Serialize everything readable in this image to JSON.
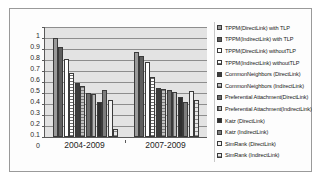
{
  "chart": {
    "type": "bar",
    "title": "",
    "xlabel": "",
    "ylabel": "",
    "ylim": [
      0,
      1
    ],
    "ytick_labels": [
      "1",
      "0.9",
      "0.8",
      "0.7",
      "0.6",
      "0.5",
      "0.4",
      "0.3",
      "0.2",
      "0.1",
      "0"
    ],
    "grid": true,
    "legend_position": "right"
  },
  "chart_data": {
    "type": "bar",
    "title": "",
    "xlabel": "",
    "ylabel": "",
    "ylim": [
      0,
      1
    ],
    "grid": true,
    "legend_position": "right",
    "categories": [
      "2004-2009",
      "2007-2009"
    ],
    "series": [
      {
        "name": "TPPM(DirectLink) with TLP",
        "values": [
          0.9,
          0.77
        ]
      },
      {
        "name": "TPPM(IndirectLink) with TLP",
        "values": [
          0.82,
          0.74
        ]
      },
      {
        "name": "TPPM(DirectLink) withoutTLP",
        "values": [
          0.71,
          0.68
        ]
      },
      {
        "name": "TPPM(IndirectLink) withoutTLP",
        "values": [
          0.58,
          0.55
        ]
      },
      {
        "name": "CommonNeighbors (DirectLink)",
        "values": [
          0.49,
          0.45
        ]
      },
      {
        "name": "CommonNeighbors (IndirectLink)",
        "values": [
          0.46,
          0.44
        ]
      },
      {
        "name": "Preferential Attachment(DirectLink)",
        "values": [
          0.4,
          0.43
        ]
      },
      {
        "name": "Preferential Attachment(IndirectLink)",
        "values": [
          0.39,
          0.41
        ]
      },
      {
        "name": "Katz (DirectLink)",
        "values": [
          0.32,
          0.36
        ]
      },
      {
        "name": "Katz (IndirectLink)",
        "values": [
          0.43,
          0.32
        ]
      },
      {
        "name": "SimRank (DirectLink)",
        "values": [
          0.34,
          0.42
        ]
      },
      {
        "name": "SimRank (IndirectLink)",
        "values": [
          0.07,
          0.34
        ]
      }
    ]
  }
}
